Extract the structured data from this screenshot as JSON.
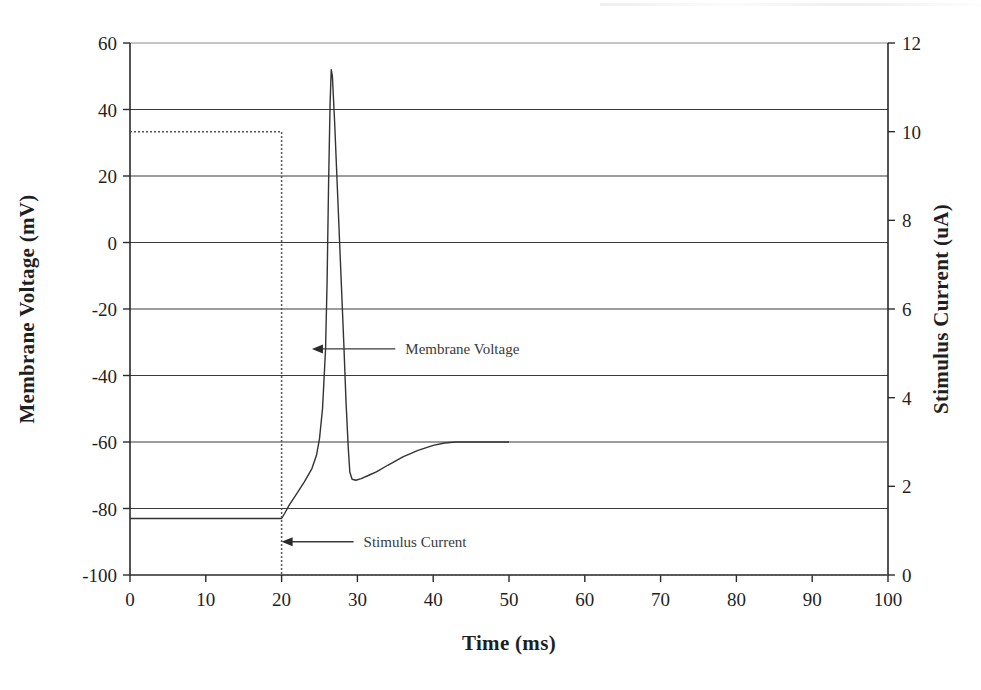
{
  "chart_data": {
    "type": "line",
    "title": "",
    "xlabel": "Time (ms)",
    "ylabel": "Membrane Voltage (mV)",
    "y2label": "Stimulus Current (uA)",
    "xlim": [
      0,
      100
    ],
    "ylim": [
      -100,
      60
    ],
    "y2lim": [
      0,
      12
    ],
    "xticks": [
      "0",
      "10",
      "20",
      "30",
      "40",
      "50",
      "60",
      "70",
      "80",
      "90",
      "100"
    ],
    "xtick_values": [
      0,
      10,
      20,
      30,
      40,
      50,
      60,
      70,
      80,
      90,
      100
    ],
    "yticks": [
      "-100",
      "-80",
      "-60",
      "-40",
      "-20",
      "0",
      "20",
      "40",
      "60"
    ],
    "ytick_values": [
      -100,
      -80,
      -60,
      -40,
      -20,
      0,
      20,
      40,
      60
    ],
    "y2ticks": [
      "0",
      "2",
      "4",
      "6",
      "8",
      "10",
      "12"
    ],
    "y2tick_values": [
      0,
      2,
      4,
      6,
      8,
      10,
      12
    ],
    "grid": true,
    "grid_axis": "y",
    "legend": "none",
    "annotations": [
      {
        "text": "Membrane Voltage",
        "arrow": "left",
        "target_x": 24.0,
        "target_y": -32.0,
        "label_x": 35.0
      },
      {
        "text": "Stimulus Current",
        "arrow": "left",
        "target_x": 20.0,
        "target_y": -90.0,
        "label_x": 29.5
      }
    ],
    "series": [
      {
        "name": "Membrane Voltage",
        "axis": "left",
        "units": "mV",
        "style": "solid",
        "color": "#333333",
        "points": [
          [
            0.0,
            -83.0
          ],
          [
            5.0,
            -83.0
          ],
          [
            10.0,
            -83.0
          ],
          [
            15.0,
            -83.0
          ],
          [
            19.0,
            -83.0
          ],
          [
            20.0,
            -83.0
          ],
          [
            20.4,
            -81.5
          ],
          [
            21.0,
            -79.0
          ],
          [
            22.0,
            -75.5
          ],
          [
            23.0,
            -72.0
          ],
          [
            24.0,
            -68.0
          ],
          [
            24.6,
            -64.0
          ],
          [
            25.0,
            -59.0
          ],
          [
            25.4,
            -50.0
          ],
          [
            25.8,
            -32.0
          ],
          [
            26.0,
            -12.0
          ],
          [
            26.2,
            18.0
          ],
          [
            26.4,
            42.0
          ],
          [
            26.55,
            52.0
          ],
          [
            26.7,
            50.0
          ],
          [
            27.0,
            36.0
          ],
          [
            27.4,
            14.0
          ],
          [
            27.8,
            -8.0
          ],
          [
            28.2,
            -30.0
          ],
          [
            28.5,
            -48.0
          ],
          [
            28.8,
            -62.0
          ],
          [
            29.0,
            -69.0
          ],
          [
            29.3,
            -71.2
          ],
          [
            29.8,
            -71.5
          ],
          [
            30.5,
            -71.0
          ],
          [
            31.5,
            -70.0
          ],
          [
            32.5,
            -69.0
          ],
          [
            34.0,
            -67.0
          ],
          [
            36.0,
            -64.5
          ],
          [
            38.0,
            -62.5
          ],
          [
            40.0,
            -61.0
          ],
          [
            41.5,
            -60.3
          ],
          [
            43.0,
            -60.0
          ],
          [
            45.0,
            -60.0
          ],
          [
            47.0,
            -60.0
          ],
          [
            50.0,
            -60.0
          ]
        ]
      },
      {
        "name": "Stimulus Current",
        "axis": "right",
        "units": "uA",
        "style": "dotted",
        "color": "#555555",
        "points": [
          [
            0.0,
            10.0
          ],
          [
            20.0,
            10.0
          ],
          [
            20.0,
            0.0
          ],
          [
            100.0,
            0.0
          ]
        ]
      }
    ]
  }
}
